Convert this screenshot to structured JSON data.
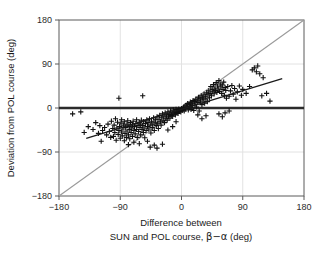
{
  "figure": {
    "background_color": "#ffffff",
    "axis_color": "#5a5a5a",
    "grid_color": "#e2e2e2",
    "identity_line_color": "#9a9a9a",
    "regression_line_color": "#1a1a1a",
    "zero_line_color": "#2b2b2b",
    "marker_color": "#111111"
  },
  "chart_data": {
    "type": "scatter",
    "title": "",
    "subtitle": "",
    "xlabel_line1": "Difference between",
    "xlabel_line2_pre": "SUN and POL course, ",
    "xlabel_line2_symbol": "β−α",
    "xlabel_line2_post": "  (deg)",
    "ylabel": "Deviation from POL course  (deg)",
    "xlim": [
      -180,
      180
    ],
    "ylim": [
      -180,
      180
    ],
    "xticks": [
      -180,
      -90,
      0,
      90,
      180
    ],
    "yticks": [
      -180,
      -90,
      0,
      90,
      180
    ],
    "xtick_labels": [
      "−180",
      "−90",
      "0",
      "90",
      "180"
    ],
    "ytick_labels": [
      "−180",
      "−90",
      "0",
      "90",
      "180"
    ],
    "grid": true,
    "legend": "none",
    "marker": "plus",
    "annotations": [
      {
        "name": "identity-line",
        "type": "line",
        "x": [
          -180,
          180
        ],
        "y": [
          -180,
          180
        ],
        "style": "gray solid",
        "label": "y = x"
      },
      {
        "name": "zero-line",
        "type": "line",
        "x": [
          -180,
          180
        ],
        "y": [
          0,
          0
        ],
        "style": "thick dark solid",
        "label": "y = 0"
      },
      {
        "name": "regression-line",
        "type": "line",
        "x": [
          -140,
          148
        ],
        "y": [
          -62,
          60
        ],
        "style": "dark solid",
        "label": "least-squares fit"
      }
    ],
    "series": [
      {
        "name": "POL deviation vs SUN-POL course difference",
        "marker": "plus",
        "color": "#111111",
        "points": [
          [
            -148,
            -8
          ],
          [
            -137,
            -38
          ],
          [
            -130,
            -44
          ],
          [
            -126,
            -30
          ],
          [
            -122,
            -52
          ],
          [
            -120,
            -36
          ],
          [
            -116,
            -46
          ],
          [
            -113,
            -40
          ],
          [
            -110,
            -55
          ],
          [
            -108,
            -33
          ],
          [
            -106,
            -48
          ],
          [
            -104,
            -60
          ],
          [
            -103,
            -27
          ],
          [
            -101,
            -42
          ],
          [
            -100,
            -58
          ],
          [
            -99,
            -35
          ],
          [
            -98,
            -50
          ],
          [
            -97,
            -22
          ],
          [
            -96,
            -66
          ],
          [
            -95,
            -41
          ],
          [
            -94,
            -29
          ],
          [
            -93,
            -54
          ],
          [
            -92,
            -46
          ],
          [
            -91,
            -38
          ],
          [
            -90,
            -62
          ],
          [
            -89,
            -31
          ],
          [
            -88,
            -49
          ],
          [
            -88,
            -24
          ],
          [
            -87,
            -57
          ],
          [
            -86,
            -43
          ],
          [
            -85,
            -35
          ],
          [
            -84,
            -67
          ],
          [
            -84,
            -28
          ],
          [
            -83,
            -52
          ],
          [
            -82,
            -40
          ],
          [
            -81,
            -60
          ],
          [
            -80,
            -33
          ],
          [
            -80,
            -47
          ],
          [
            -79,
            -26
          ],
          [
            -78,
            -55
          ],
          [
            -78,
            -75
          ],
          [
            -77,
            -38
          ],
          [
            -76,
            -44
          ],
          [
            -76,
            -63
          ],
          [
            -75,
            -30
          ],
          [
            -74,
            -50
          ],
          [
            -73,
            -41
          ],
          [
            -72,
            -58
          ],
          [
            -72,
            -35
          ],
          [
            -71,
            -27
          ],
          [
            -70,
            -46
          ],
          [
            -70,
            -70
          ],
          [
            -69,
            -38
          ],
          [
            -68,
            -53
          ],
          [
            -67,
            -32
          ],
          [
            -66,
            -44
          ],
          [
            -66,
            -24
          ],
          [
            -65,
            -60
          ],
          [
            -64,
            -36
          ],
          [
            -63,
            -48
          ],
          [
            -62,
            -29
          ],
          [
            -62,
            -73
          ],
          [
            -61,
            -40
          ],
          [
            -60,
            -55
          ],
          [
            -60,
            -33
          ],
          [
            -59,
            -25
          ],
          [
            -58,
            -44
          ],
          [
            -57,
            -36
          ],
          [
            -56,
            -50
          ],
          [
            -56,
            -28
          ],
          [
            -55,
            -41
          ],
          [
            -54,
            -61
          ],
          [
            -53,
            -32
          ],
          [
            -52,
            -46
          ],
          [
            -51,
            -24
          ],
          [
            -50,
            -38
          ],
          [
            -50,
            -68
          ],
          [
            -49,
            -30
          ],
          [
            -48,
            -43
          ],
          [
            -47,
            -22
          ],
          [
            -46,
            -35
          ],
          [
            -45,
            -51
          ],
          [
            -44,
            -27
          ],
          [
            -43,
            -40
          ],
          [
            -42,
            -33
          ],
          [
            -41,
            -20
          ],
          [
            -40,
            -46
          ],
          [
            -40,
            -76
          ],
          [
            -39,
            -29
          ],
          [
            -38,
            -24
          ],
          [
            -37,
            -36
          ],
          [
            -36,
            -18
          ],
          [
            -35,
            -31
          ],
          [
            -34,
            -42
          ],
          [
            -33,
            -23
          ],
          [
            -32,
            -15
          ],
          [
            -31,
            -28
          ],
          [
            -30,
            -35
          ],
          [
            -29,
            -20
          ],
          [
            -28,
            -12
          ],
          [
            -27,
            -26
          ],
          [
            -26,
            -18
          ],
          [
            -25,
            -30
          ],
          [
            -24,
            -10
          ],
          [
            -23,
            -22
          ],
          [
            -22,
            -16
          ],
          [
            -21,
            -25
          ],
          [
            -20,
            -8
          ],
          [
            -19,
            -18
          ],
          [
            -18,
            -13
          ],
          [
            -17,
            -21
          ],
          [
            -16,
            -6
          ],
          [
            -15,
            -15
          ],
          [
            -14,
            -10
          ],
          [
            -13,
            -17
          ],
          [
            -12,
            -4
          ],
          [
            -11,
            -12
          ],
          [
            -10,
            -8
          ],
          [
            -9,
            -14
          ],
          [
            -8,
            -3
          ],
          [
            -7,
            -9
          ],
          [
            -6,
            -6
          ],
          [
            -5,
            -11
          ],
          [
            -4,
            -2
          ],
          [
            -3,
            -7
          ],
          [
            -2,
            -4
          ],
          [
            -1,
            -8
          ],
          [
            0,
            -1
          ],
          [
            1,
            -5
          ],
          [
            2,
            -3
          ],
          [
            3,
            2
          ],
          [
            4,
            -6
          ],
          [
            5,
            4
          ],
          [
            6,
            -2
          ],
          [
            7,
            6
          ],
          [
            8,
            1
          ],
          [
            9,
            9
          ],
          [
            10,
            -4
          ],
          [
            11,
            7
          ],
          [
            12,
            3
          ],
          [
            13,
            12
          ],
          [
            14,
            -3
          ],
          [
            15,
            10
          ],
          [
            16,
            5
          ],
          [
            17,
            15
          ],
          [
            18,
            -5
          ],
          [
            19,
            13
          ],
          [
            20,
            8
          ],
          [
            21,
            18
          ],
          [
            22,
            2
          ],
          [
            23,
            16
          ],
          [
            24,
            11
          ],
          [
            25,
            22
          ],
          [
            26,
            -6
          ],
          [
            27,
            19
          ],
          [
            28,
            14
          ],
          [
            29,
            25
          ],
          [
            30,
            7
          ],
          [
            31,
            21
          ],
          [
            32,
            17
          ],
          [
            33,
            28
          ],
          [
            34,
            10
          ],
          [
            35,
            24
          ],
          [
            36,
            19
          ],
          [
            37,
            31
          ],
          [
            38,
            13
          ],
          [
            39,
            27
          ],
          [
            40,
            35
          ],
          [
            41,
            21
          ],
          [
            42,
            30
          ],
          [
            43,
            44
          ],
          [
            44,
            25
          ],
          [
            45,
            38
          ],
          [
            46,
            33
          ],
          [
            47,
            48
          ],
          [
            48,
            29
          ],
          [
            49,
            41
          ],
          [
            50,
            36
          ],
          [
            51,
            52
          ],
          [
            52,
            32
          ],
          [
            53,
            45
          ],
          [
            54,
            39
          ],
          [
            55,
            56
          ],
          [
            56,
            34
          ],
          [
            57,
            49
          ],
          [
            58,
            43
          ],
          [
            59,
            30
          ],
          [
            60,
            47
          ],
          [
            61,
            38
          ],
          [
            62,
            53
          ],
          [
            63,
            26
          ],
          [
            64,
            42
          ],
          [
            65,
            36
          ],
          [
            66,
            20
          ],
          [
            68,
            44
          ],
          [
            70,
            24
          ],
          [
            72,
            35
          ],
          [
            74,
            46
          ],
          [
            76,
            28
          ],
          [
            78,
            40
          ],
          [
            80,
            18
          ],
          [
            82,
            33
          ],
          [
            85,
            45
          ],
          [
            88,
            26
          ],
          [
            90,
            38
          ],
          [
            95,
            30
          ],
          [
            100,
            44
          ],
          [
            104,
            78
          ],
          [
            107,
            82
          ],
          [
            110,
            74
          ],
          [
            112,
            86
          ],
          [
            115,
            70
          ],
          [
            118,
            25
          ],
          [
            120,
            62
          ],
          [
            125,
            30
          ],
          [
            130,
            14
          ],
          [
            -160,
            -12
          ],
          [
            -143,
            -50
          ],
          [
            -118,
            -68
          ],
          [
            -92,
            20
          ],
          [
            -57,
            25
          ],
          [
            -46,
            -80
          ],
          [
            -36,
            -82
          ],
          [
            -28,
            -74
          ],
          [
            -20,
            -45
          ],
          [
            -13,
            -38
          ],
          [
            -8,
            -28
          ],
          [
            55,
            -12
          ],
          [
            60,
            -18
          ],
          [
            64,
            -10
          ],
          [
            70,
            -6
          ],
          [
            36,
            -16
          ],
          [
            30,
            -22
          ],
          [
            24,
            -14
          ]
        ]
      }
    ]
  }
}
